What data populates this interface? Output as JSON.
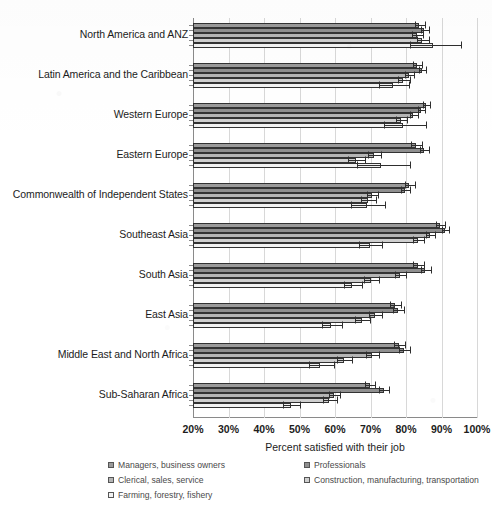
{
  "chart_data": {
    "type": "bar",
    "orientation": "horizontal",
    "title": "",
    "xlabel": "Percent satisfied with their job",
    "ylabel": "",
    "xlim": [
      20,
      100
    ],
    "xtick_labels": [
      "20%",
      "30%",
      "40%",
      "50%",
      "60%",
      "70%",
      "80%",
      "90%",
      "100%"
    ],
    "xtick_values": [
      20,
      30,
      40,
      50,
      60,
      70,
      80,
      90,
      100
    ],
    "grid": true,
    "legend_position": "bottom",
    "error_bars": true,
    "categories": [
      "North America and ANZ",
      "Latin America and the Caribbean",
      "Western Europe",
      "Eastern Europe",
      "Commonwealth of Independent States",
      "Southeast Asia",
      "South Asia",
      "East Asia",
      "Middle East and North Africa",
      "Sub-Saharan Africa"
    ],
    "series": [
      {
        "name": "Managers, business owners",
        "color": "#9a9a9a",
        "values": [
          83.7,
          83.1,
          85.6,
          82.8,
          80.9,
          89.6,
          83.4,
          76.9,
          78.0,
          69.8
        ],
        "err_low": [
          1.2,
          1.0,
          0.9,
          1.4,
          1.3,
          1.1,
          1.4,
          1.5,
          1.4,
          1.4
        ],
        "err_high": [
          1.6,
          1.3,
          1.2,
          1.7,
          1.5,
          1.3,
          1.7,
          1.8,
          1.7,
          1.6
        ]
      },
      {
        "name": "Professionals",
        "color": "#8f8f8f",
        "values": [
          85.1,
          84.5,
          84.2,
          85.1,
          79.7,
          91.0,
          85.4,
          77.7,
          79.4,
          73.8
        ],
        "err_low": [
          1.0,
          0.9,
          0.8,
          1.2,
          1.2,
          1.0,
          1.3,
          1.4,
          1.3,
          1.3
        ],
        "err_high": [
          1.4,
          1.2,
          1.1,
          1.5,
          1.4,
          1.2,
          1.6,
          1.7,
          1.6,
          1.5
        ]
      },
      {
        "name": "Clerical, sales, service",
        "color": "#b5b5b5",
        "values": [
          83.1,
          80.9,
          82.0,
          71.0,
          70.4,
          86.8,
          78.3,
          71.3,
          70.4,
          59.7
        ],
        "err_low": [
          1.3,
          1.1,
          1.0,
          1.6,
          1.5,
          1.2,
          1.5,
          1.6,
          1.6,
          1.5
        ],
        "err_high": [
          1.7,
          1.4,
          1.3,
          2.0,
          1.8,
          1.4,
          1.8,
          1.9,
          1.9,
          1.8
        ]
      },
      {
        "name": "Construction, manufacturing, transportation",
        "color": "#cfcfcf",
        "values": [
          84.5,
          79.2,
          78.6,
          65.9,
          69.3,
          83.4,
          70.1,
          67.6,
          62.5,
          58.3
        ],
        "err_low": [
          1.5,
          1.4,
          1.3,
          2.1,
          1.9,
          1.5,
          1.8,
          1.9,
          2.0,
          1.8
        ],
        "err_high": [
          1.9,
          1.8,
          1.7,
          2.6,
          2.3,
          1.8,
          2.2,
          2.3,
          2.4,
          2.2
        ]
      },
      {
        "name": "Farming, forestry, fishery",
        "color": "#f2f2f2",
        "values": [
          87.6,
          76.3,
          79.2,
          73.0,
          69.0,
          69.9,
          64.8,
          58.9,
          55.8,
          47.6
        ],
        "err_low": [
          6.5,
          4.0,
          5.5,
          6.8,
          4.5,
          3.0,
          2.4,
          2.6,
          3.2,
          2.2
        ],
        "err_high": [
          8.0,
          4.6,
          6.5,
          8.0,
          5.2,
          3.4,
          2.8,
          3.0,
          3.8,
          2.6
        ]
      }
    ]
  },
  "axis": {
    "x_title": "Percent satisfied with their job"
  },
  "legend": {
    "items": [
      {
        "label": "Managers, business owners",
        "swatch": "#9a9a9a"
      },
      {
        "label": "Professionals",
        "swatch": "#8f8f8f"
      },
      {
        "label": "Clerical, sales, service",
        "swatch": "#b5b5b5"
      },
      {
        "label": "Construction, manufacturing, transportation",
        "swatch": "#cfcfcf"
      },
      {
        "label": "Farming, forestry, fishery",
        "swatch": "#f2f2f2"
      }
    ]
  }
}
